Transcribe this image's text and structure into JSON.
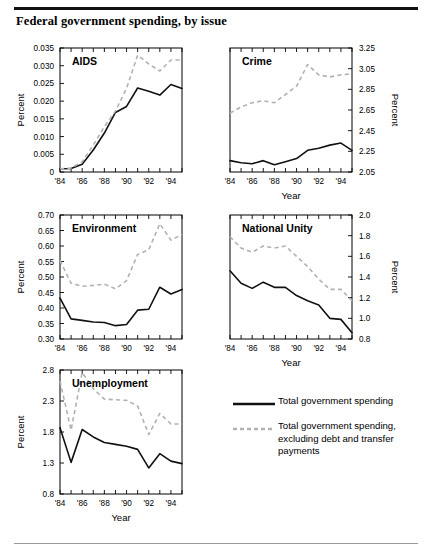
{
  "figure": {
    "title": "Federal government spending, by issue",
    "x_axis_label": "Year",
    "y_axis_label": "Percent"
  },
  "legend": {
    "items": [
      {
        "key": "solid-line-key",
        "label": "Total government spending",
        "color": "#111111",
        "style": "solid"
      },
      {
        "key": "dashed-line-key",
        "label": "Total government spending, excluding debt and transfer payments",
        "color": "#b2b2b2",
        "style": "dashed"
      }
    ]
  },
  "chart_data": [
    {
      "type": "line",
      "title": "AIDS",
      "xlabel": "",
      "ylabel": "Percent",
      "y_axis_side": "left",
      "x": [
        1984,
        1985,
        1986,
        1987,
        1988,
        1989,
        1990,
        1991,
        1992,
        1993,
        1994,
        1995
      ],
      "xlim": [
        1984,
        1995
      ],
      "xticks": [
        1984,
        1985,
        1986,
        1987,
        1988,
        1989,
        1990,
        1991,
        1992,
        1993,
        1994,
        1995
      ],
      "xticklabels": [
        "'84",
        "",
        "'86",
        "",
        "'88",
        "",
        "'90",
        "",
        "'92",
        "",
        "'94",
        ""
      ],
      "ylim": [
        0,
        0.035
      ],
      "yticks": [
        0,
        0.005,
        0.01,
        0.015,
        0.02,
        0.025,
        0.03,
        0.035
      ],
      "yticklabels": [
        "0",
        "0.005",
        "0.010",
        "0.015",
        "0.020",
        "0.025",
        "0.030",
        "0.035"
      ],
      "grid": false,
      "series": [
        {
          "name": "Total government spending",
          "style": "solid",
          "values": [
            0.0009,
            0.001,
            0.0022,
            0.0062,
            0.011,
            0.0168,
            0.0185,
            0.0237,
            0.0228,
            0.0217,
            0.0247,
            0.0236
          ]
        },
        {
          "name": "Total government spending, excluding debt and transfer payments",
          "style": "dashed",
          "values": [
            0.0009,
            0.0011,
            0.0029,
            0.0076,
            0.0128,
            0.0172,
            0.0236,
            0.033,
            0.0305,
            0.0285,
            0.0316,
            0.0316
          ]
        }
      ]
    },
    {
      "type": "line",
      "title": "Crime",
      "xlabel": "Year",
      "ylabel": "Percent",
      "y_axis_side": "right",
      "x": [
        1984,
        1985,
        1986,
        1987,
        1988,
        1989,
        1990,
        1991,
        1992,
        1993,
        1994,
        1995
      ],
      "xlim": [
        1984,
        1995
      ],
      "xticks": [
        1984,
        1985,
        1986,
        1987,
        1988,
        1989,
        1990,
        1991,
        1992,
        1993,
        1994,
        1995
      ],
      "xticklabels": [
        "'84",
        "",
        "'86",
        "",
        "'88",
        "",
        "'90",
        "",
        "'92",
        "",
        "'94",
        ""
      ],
      "ylim": [
        2.05,
        3.25
      ],
      "yticks": [
        2.05,
        2.25,
        2.45,
        2.65,
        2.85,
        3.05,
        3.25
      ],
      "yticklabels": [
        "2.05",
        "2.25",
        "2.45",
        "2.65",
        "2.85",
        "3.05",
        "3.25"
      ],
      "grid": false,
      "series": [
        {
          "name": "Total government spending",
          "style": "solid",
          "values": [
            2.16,
            2.14,
            2.13,
            2.16,
            2.12,
            2.15,
            2.18,
            2.26,
            2.28,
            2.31,
            2.33,
            2.26
          ]
        },
        {
          "name": "Total government spending, excluding debt and transfer payments",
          "style": "dashed",
          "values": [
            2.62,
            2.68,
            2.72,
            2.74,
            2.72,
            2.8,
            2.88,
            3.09,
            2.99,
            2.97,
            2.99,
            3.0
          ]
        }
      ]
    },
    {
      "type": "line",
      "title": "Environment",
      "xlabel": "",
      "ylabel": "Percent",
      "y_axis_side": "left",
      "x": [
        1984,
        1985,
        1986,
        1987,
        1988,
        1989,
        1990,
        1991,
        1992,
        1993,
        1994,
        1995
      ],
      "xlim": [
        1984,
        1995
      ],
      "xticks": [
        1984,
        1985,
        1986,
        1987,
        1988,
        1989,
        1990,
        1991,
        1992,
        1993,
        1994,
        1995
      ],
      "xticklabels": [
        "'84",
        "",
        "'86",
        "",
        "'88",
        "",
        "'90",
        "",
        "'92",
        "",
        "'94",
        ""
      ],
      "ylim": [
        0.3,
        0.7
      ],
      "yticks": [
        0.3,
        0.35,
        0.4,
        0.45,
        0.5,
        0.55,
        0.6,
        0.65,
        0.7
      ],
      "yticklabels": [
        "0.30",
        "0.35",
        "0.40",
        "0.45",
        "0.50",
        "0.55",
        "0.60",
        "0.65",
        "0.70"
      ],
      "grid": false,
      "series": [
        {
          "name": "Total government spending",
          "style": "solid",
          "values": [
            0.432,
            0.365,
            0.36,
            0.355,
            0.353,
            0.343,
            0.347,
            0.393,
            0.396,
            0.467,
            0.445,
            0.46
          ]
        },
        {
          "name": "Total government spending, excluding debt and transfer payments",
          "style": "dashed",
          "values": [
            0.553,
            0.48,
            0.47,
            0.473,
            0.477,
            0.462,
            0.488,
            0.573,
            0.588,
            0.672,
            0.619,
            0.637
          ]
        }
      ]
    },
    {
      "type": "line",
      "title": "National Unity",
      "xlabel": "Year",
      "ylabel": "Percent",
      "y_axis_side": "right",
      "x": [
        1984,
        1985,
        1986,
        1987,
        1988,
        1989,
        1990,
        1991,
        1992,
        1993,
        1994,
        1995
      ],
      "xlim": [
        1984,
        1995
      ],
      "xticks": [
        1984,
        1985,
        1986,
        1987,
        1988,
        1989,
        1990,
        1991,
        1992,
        1993,
        1994,
        1995
      ],
      "xticklabels": [
        "'84",
        "",
        "'86",
        "",
        "'88",
        "",
        "'90",
        "",
        "'92",
        "",
        "'94",
        ""
      ],
      "ylim": [
        0.8,
        2.0
      ],
      "yticks": [
        0.8,
        1.0,
        1.2,
        1.4,
        1.6,
        1.8,
        2.0
      ],
      "yticklabels": [
        "0.8",
        "1.0",
        "1.2",
        "1.4",
        "1.6",
        "1.8",
        "2.0"
      ],
      "grid": false,
      "series": [
        {
          "name": "Total government spending",
          "style": "solid",
          "values": [
            1.46,
            1.34,
            1.29,
            1.35,
            1.3,
            1.3,
            1.22,
            1.17,
            1.13,
            1.0,
            0.99,
            0.86
          ]
        },
        {
          "name": "Total government spending, excluding debt and transfer payments",
          "style": "dashed",
          "values": [
            1.79,
            1.68,
            1.64,
            1.7,
            1.68,
            1.7,
            1.6,
            1.5,
            1.38,
            1.28,
            1.28,
            1.17
          ]
        }
      ]
    },
    {
      "type": "line",
      "title": "Unemployment",
      "xlabel": "Year",
      "ylabel": "Percent",
      "y_axis_side": "left",
      "x": [
        1984,
        1985,
        1986,
        1987,
        1988,
        1989,
        1990,
        1991,
        1992,
        1993,
        1994,
        1995
      ],
      "xlim": [
        1984,
        1995
      ],
      "xticks": [
        1984,
        1985,
        1986,
        1987,
        1988,
        1989,
        1990,
        1991,
        1992,
        1993,
        1994,
        1995
      ],
      "xticklabels": [
        "'84",
        "",
        "'86",
        "",
        "'88",
        "",
        "'90",
        "",
        "'92",
        "",
        "'94",
        ""
      ],
      "ylim": [
        0.8,
        2.8
      ],
      "yticks": [
        0.8,
        1.3,
        1.8,
        2.3,
        2.8
      ],
      "yticklabels": [
        "0.8",
        "1.3",
        "1.8",
        "2.3",
        "2.8"
      ],
      "grid": false,
      "series": [
        {
          "name": "Total government spending",
          "style": "solid",
          "values": [
            1.87,
            1.31,
            1.84,
            1.72,
            1.63,
            1.6,
            1.57,
            1.52,
            1.22,
            1.45,
            1.33,
            1.29
          ]
        },
        {
          "name": "Total government spending, excluding debt and transfer payments",
          "style": "dashed",
          "values": [
            2.62,
            1.83,
            2.76,
            2.5,
            2.33,
            2.32,
            2.31,
            2.22,
            1.76,
            2.1,
            1.93,
            1.93
          ]
        }
      ]
    }
  ]
}
